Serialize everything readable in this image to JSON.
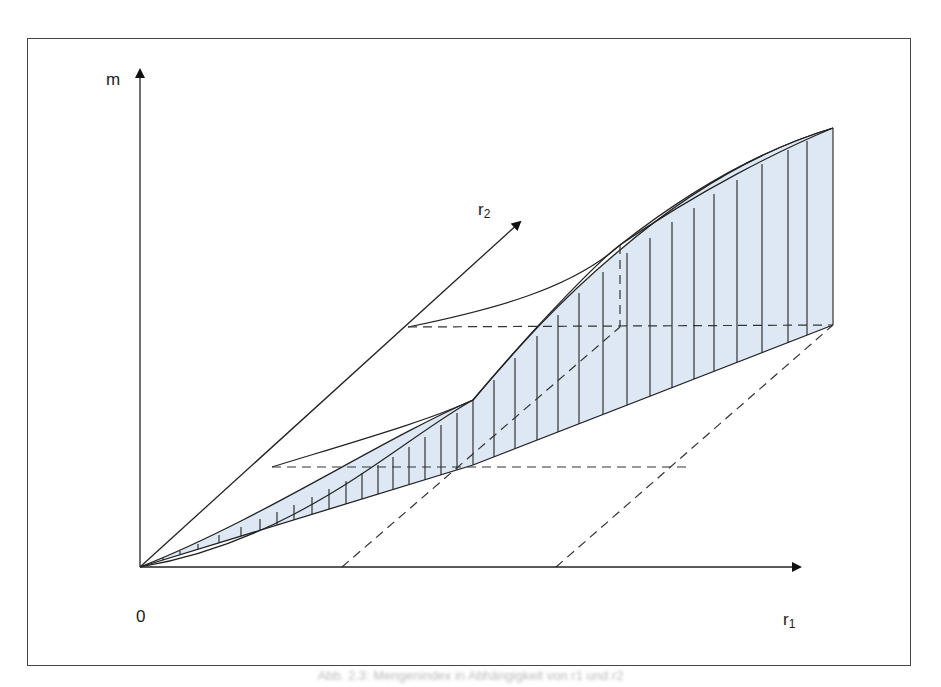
{
  "diagram": {
    "axes": {
      "vertical_label": "m",
      "horizontal_label": "r",
      "horizontal_subscript": "1",
      "oblique_label": "r",
      "oblique_subscript": "2",
      "origin_label": "0"
    },
    "fill_color": "#dde8f4",
    "line_color": "#222222",
    "caption": "Abb. 2.3: Mengenindex in Abhängigkeit von r1 und r2"
  }
}
